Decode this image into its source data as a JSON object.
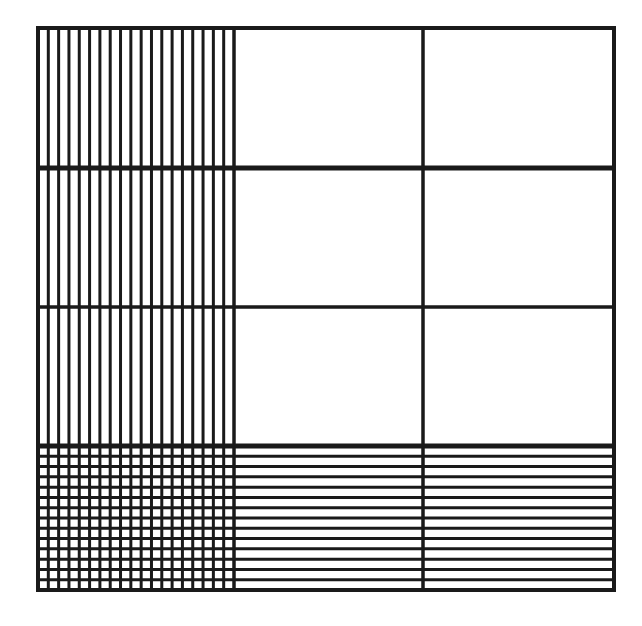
{
  "diagram": {
    "type": "area-model-grid",
    "columns": 3,
    "rows": 4,
    "stroke_color": "#1a1a1a",
    "background": "#ffffff",
    "shaded_column_index": 0,
    "shaded_row_index": 3,
    "vertical_stripes_in_column": 19,
    "horizontal_stripes_in_row": 14,
    "bounds": {
      "x0": 38,
      "y0": 28,
      "x1": 614,
      "y1": 590
    },
    "column_edges": [
      38,
      234,
      423,
      614
    ],
    "row_edges": [
      28,
      168,
      307,
      446,
      590
    ]
  }
}
